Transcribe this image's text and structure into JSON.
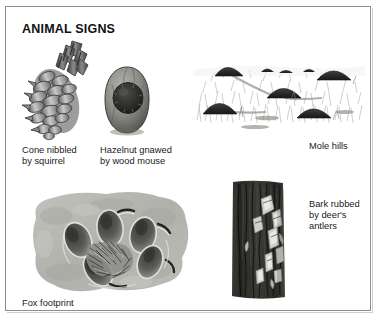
{
  "panel": {
    "title": "ANIMAL SIGNS",
    "border_color": "#8e8e8e",
    "background_color": "#ffffff"
  },
  "figures": [
    {
      "id": "cone",
      "icon": "pine-cone-nibbled-illustration",
      "caption": "Cone nibbled\nby squirrel"
    },
    {
      "id": "hazelnut",
      "icon": "hazelnut-gnawed-illustration",
      "caption": "Hazelnut gnawed\nby wood mouse"
    },
    {
      "id": "molehills",
      "icon": "mole-hills-field-illustration",
      "caption": "Mole hills"
    },
    {
      "id": "foxprint",
      "icon": "fox-footprint-illustration",
      "caption": "Fox footprint"
    },
    {
      "id": "bark",
      "icon": "rubbed-tree-bark-illustration",
      "caption": "Bark rubbed\nby deer's\nantlers"
    }
  ],
  "colors": {
    "text": "#1a1a1a",
    "ink_dark": "#2b2b2b",
    "ink_mid": "#6e6e6e",
    "ink_light": "#b9b9b9",
    "mud": "#b5b5b0"
  }
}
